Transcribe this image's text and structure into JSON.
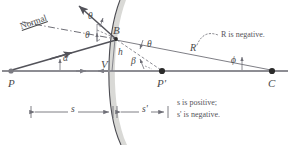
{
  "diagram": {
    "type": "ray-diagram-spherical-mirror",
    "colors": {
      "axis": "#8d8d93",
      "ray": "#53535a",
      "construction": "#6f6f77",
      "mirror": "#4c4c52",
      "mirror_shadow": "#d2d2cf",
      "text": "#4a4a4a",
      "note_text": "#55545a",
      "point": "#2b2b2b",
      "dimension": "#6f6f77"
    },
    "points": [
      {
        "id": "P",
        "label": "P",
        "x": 11,
        "y": 71,
        "dot": true,
        "label_dx": -3,
        "label_dy": 10
      },
      {
        "id": "V",
        "label": "V",
        "x": 113,
        "y": 71,
        "dot": false,
        "label_dx": -9,
        "label_dy": -3
      },
      {
        "id": "Pprime",
        "label": "P'",
        "x": 162,
        "y": 71,
        "dot": true,
        "label_dx": -4,
        "label_dy": 11
      },
      {
        "id": "C",
        "label": "C",
        "x": 272,
        "y": 71,
        "dot": true,
        "label_dx": -3,
        "label_dy": 11
      },
      {
        "id": "B",
        "label": "B",
        "x": 116,
        "y": 39,
        "dot": true,
        "label_dx": -3,
        "label_dy": -4
      }
    ],
    "angle_labels": [
      {
        "id": "theta-incident",
        "text": "θ",
        "x": 92,
        "y": 17
      },
      {
        "id": "theta-reflected",
        "text": "θ",
        "x": 88,
        "y": 36
      },
      {
        "id": "theta-axis",
        "text": "θ",
        "x": 147,
        "y": 44
      },
      {
        "id": "alpha",
        "text": "α",
        "x": 64,
        "y": 59
      },
      {
        "id": "beta",
        "text": "β",
        "x": 135,
        "y": 62
      },
      {
        "id": "phi",
        "text": "ϕ",
        "x": 233,
        "y": 61
      },
      {
        "id": "h",
        "text": "h",
        "x": 120,
        "y": 53
      },
      {
        "id": "R",
        "text": "R",
        "x": 193,
        "y": 49
      }
    ],
    "text_labels": {
      "normal": "Normal",
      "r_negative": "R is negative.",
      "s_positive": "s is positive;",
      "s_negative": "s' is negative."
    },
    "dimensions": [
      {
        "id": "s",
        "label": "s",
        "x1": 31,
        "x2": 113,
        "y": 112
      },
      {
        "id": "s-prime",
        "label": "s'",
        "x1": 117,
        "x2": 168,
        "y": 112
      }
    ],
    "sign_convention": {
      "s": "positive",
      "s_prime": "negative",
      "R": "negative"
    }
  }
}
